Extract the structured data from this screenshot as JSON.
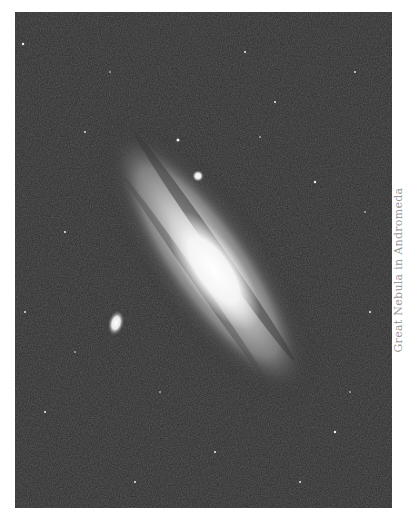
{
  "figure": {
    "caption": "Great Nebula in Andromeda",
    "colors": {
      "sky": "#2b2b2b",
      "core": "#ffffff",
      "caption": "#9a9a9a"
    }
  }
}
